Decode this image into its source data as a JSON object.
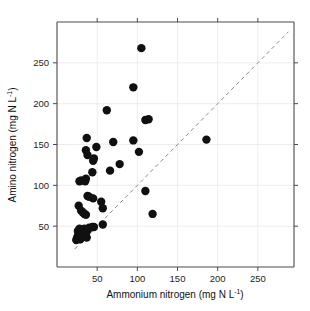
{
  "chart_data": {
    "type": "scatter",
    "title": "",
    "xlabel": "Ammonium nitrogen (mg N L⁻¹)",
    "ylabel": "Amino nitrogen (mg N L⁻¹)",
    "xlabel_main": "Ammonium nitrogen (mg N L",
    "xlabel_sup": "-1",
    "xlabel_tail": ")",
    "ylabel_main": "Amino nitrogen (mg N L",
    "ylabel_sup": "-1",
    "ylabel_tail": ")",
    "xlim": [
      0,
      295
    ],
    "ylim": [
      0,
      300
    ],
    "xticks": [
      50,
      100,
      150,
      200,
      250
    ],
    "yticks": [
      50,
      100,
      150,
      200,
      250
    ],
    "xticklabels": [
      "50",
      "100",
      "150",
      "200",
      "250"
    ],
    "yticklabels": [
      "50",
      "100",
      "150",
      "200",
      "250"
    ],
    "grid": true,
    "legend": "none",
    "marker": "filled-circle",
    "marker_color": "#101010",
    "marker_size": 4.2,
    "reference_line": {
      "name": "one-to-one-line",
      "style": "dashed",
      "color": "#8d8d8d",
      "slope": 1,
      "intercept": 0,
      "x_start": 22,
      "x_end": 288
    },
    "points": [
      {
        "x": 24,
        "y": 33
      },
      {
        "x": 25,
        "y": 36
      },
      {
        "x": 26,
        "y": 38
      },
      {
        "x": 27,
        "y": 41
      },
      {
        "x": 26,
        "y": 44
      },
      {
        "x": 28,
        "y": 47
      },
      {
        "x": 29,
        "y": 34
      },
      {
        "x": 31,
        "y": 36
      },
      {
        "x": 32,
        "y": 39
      },
      {
        "x": 30,
        "y": 42
      },
      {
        "x": 33,
        "y": 44
      },
      {
        "x": 34,
        "y": 47
      },
      {
        "x": 36,
        "y": 41
      },
      {
        "x": 37,
        "y": 36
      },
      {
        "x": 38,
        "y": 45
      },
      {
        "x": 40,
        "y": 48
      },
      {
        "x": 44,
        "y": 49
      },
      {
        "x": 46,
        "y": 49
      },
      {
        "x": 57,
        "y": 52
      },
      {
        "x": 27,
        "y": 75
      },
      {
        "x": 30,
        "y": 69
      },
      {
        "x": 32,
        "y": 67
      },
      {
        "x": 34,
        "y": 65
      },
      {
        "x": 36,
        "y": 64
      },
      {
        "x": 38,
        "y": 87
      },
      {
        "x": 40,
        "y": 86
      },
      {
        "x": 45,
        "y": 84
      },
      {
        "x": 55,
        "y": 80
      },
      {
        "x": 57,
        "y": 72
      },
      {
        "x": 28,
        "y": 105
      },
      {
        "x": 30,
        "y": 106
      },
      {
        "x": 35,
        "y": 105
      },
      {
        "x": 36,
        "y": 108
      },
      {
        "x": 44,
        "y": 116
      },
      {
        "x": 45,
        "y": 130
      },
      {
        "x": 46,
        "y": 133
      },
      {
        "x": 38,
        "y": 137
      },
      {
        "x": 36,
        "y": 143
      },
      {
        "x": 37,
        "y": 158
      },
      {
        "x": 49,
        "y": 147
      },
      {
        "x": 66,
        "y": 118
      },
      {
        "x": 78,
        "y": 126
      },
      {
        "x": 70,
        "y": 153
      },
      {
        "x": 62,
        "y": 192
      },
      {
        "x": 95,
        "y": 220
      },
      {
        "x": 105,
        "y": 268
      },
      {
        "x": 95,
        "y": 155
      },
      {
        "x": 102,
        "y": 141
      },
      {
        "x": 110,
        "y": 180
      },
      {
        "x": 114,
        "y": 181
      },
      {
        "x": 110,
        "y": 93
      },
      {
        "x": 119,
        "y": 65
      },
      {
        "x": 186,
        "y": 156
      }
    ]
  },
  "figure": {
    "name": "scatter-plot-figure",
    "background": "#ffffff"
  }
}
